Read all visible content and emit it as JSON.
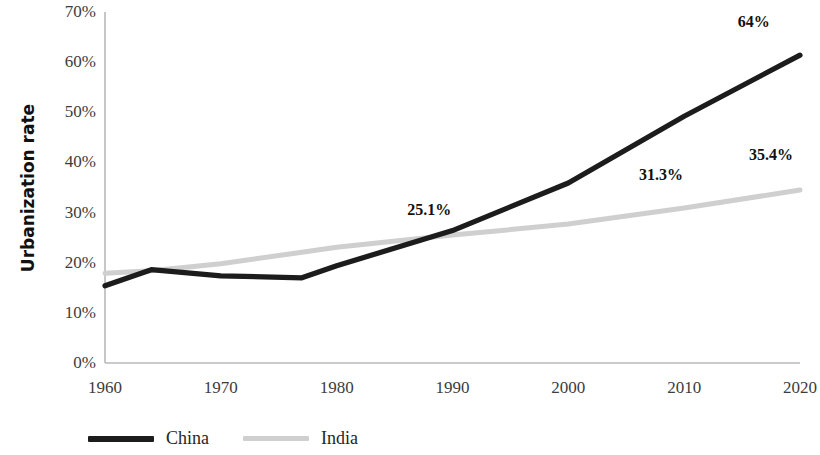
{
  "chart_data": {
    "type": "line",
    "title": "",
    "subtitle": "",
    "xlabel": "",
    "ylabel": "Urbanization rate",
    "xlim": [
      1960,
      2020
    ],
    "ylim": [
      0,
      70
    ],
    "grid": false,
    "legend_position": "bottom-left",
    "x_tick_labels": [
      "1960",
      "1970",
      "1980",
      "1990",
      "2000",
      "2010",
      "2020"
    ],
    "x_ticks": [
      1960,
      1970,
      1980,
      1990,
      2000,
      2010,
      2020
    ],
    "y_tick_labels": [
      "0%",
      "10%",
      "20%",
      "30%",
      "40%",
      "50%",
      "60%",
      "70%"
    ],
    "y_ticks": [
      0,
      10,
      20,
      30,
      40,
      50,
      60,
      70
    ],
    "series": [
      {
        "name": "China",
        "color": "#1c1c1c",
        "x": [
          1960,
          1964,
          1970,
          1977,
          1980,
          1990,
          2000,
          2010,
          2020
        ],
        "values": [
          15.4,
          18.6,
          17.4,
          17.0,
          19.4,
          26.4,
          35.9,
          49.2,
          61.4
        ]
      },
      {
        "name": "India",
        "color": "#cfcfcf",
        "x": [
          1960,
          1964,
          1970,
          1977,
          1980,
          1990,
          2000,
          2010,
          2020
        ],
        "values": [
          17.9,
          18.4,
          19.8,
          22.1,
          23.1,
          25.5,
          27.7,
          30.9,
          34.5
        ]
      }
    ],
    "annotations": [
      {
        "text": "25.1%",
        "x": 1988.0,
        "y": 30.5,
        "series": "India"
      },
      {
        "text": "31.3%",
        "x": 2008.0,
        "y": 37.5,
        "series": "India"
      },
      {
        "text": "35.4%",
        "x": 2017.5,
        "y": 41.5,
        "series": "India"
      },
      {
        "text": "64%",
        "x": 2016.0,
        "y": 68.0,
        "series": "China"
      }
    ]
  },
  "legend": {
    "items": [
      {
        "label": "China",
        "swatch": "line-swatch-black"
      },
      {
        "label": "India",
        "swatch": "line-swatch-gray"
      }
    ]
  }
}
